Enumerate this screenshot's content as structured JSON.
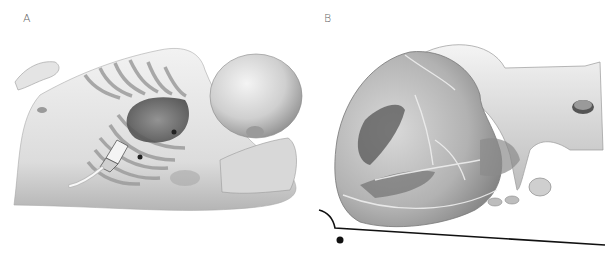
{
  "figure": {
    "panels": [
      {
        "label": "A",
        "subject": "infant lying supine with transparent rib cage showing heart and ultrasound transducer placed subcostally",
        "icons": [
          "infant-body-icon",
          "rib-cage-icon",
          "heart-icon",
          "ultrasound-probe-icon"
        ]
      },
      {
        "label": "B",
        "subject": "enlarged heart with great vessels and imaging plane line with reference dot",
        "icons": [
          "heart-icon",
          "aorta-icon",
          "imaging-plane-line-icon",
          "reference-dot-icon"
        ]
      }
    ],
    "colors": {
      "background": "#ffffff",
      "skin": "#e8e8e8",
      "shadow": "#9a9a9a",
      "dark": "#3a3a3a",
      "line": "#111111",
      "label": "#666666"
    }
  }
}
